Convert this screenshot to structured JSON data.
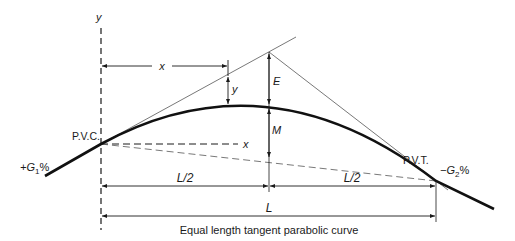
{
  "diagram": {
    "caption": "Equal length tangent parabolic curve",
    "axis_labels": {
      "y": "y",
      "x": "x"
    },
    "points": {
      "pvc": "P.V.C.",
      "pvt": "P.V.T."
    },
    "grades": {
      "g1": "+G",
      "g1_sub": "1",
      "g1_pct": "%",
      "g2": "−G",
      "g2_sub": "2",
      "g2_pct": "%"
    },
    "dimensions": {
      "x": "x",
      "y": "y",
      "E": "E",
      "M": "M",
      "half_left": "L/2",
      "half_right": "L/2",
      "total": "L"
    },
    "colors": {
      "ink": "#1a1a1a",
      "thin": "#555555"
    }
  }
}
